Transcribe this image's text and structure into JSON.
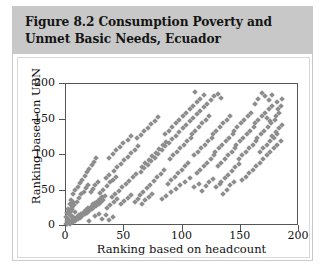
{
  "figure": {
    "title_line1": "Figure 8.2  Consumption Poverty and",
    "title_line2": "Unmet Basic Needs, Ecuador",
    "header_color": "#c8c8c8",
    "body_color": "#ffffff",
    "border_color": "#c9c9c9"
  },
  "chart_data": {
    "type": "scatter",
    "title": "Figure 8.2  Consumption Poverty and Unmet Basic Needs, Ecuador",
    "xlabel": "Ranking based on headcount",
    "ylabel": "Ranking based on UBN",
    "xlim": [
      0,
      200
    ],
    "ylim": [
      0,
      200
    ],
    "xticks": [
      0,
      50,
      100,
      150,
      200
    ],
    "yticks": [
      0,
      50,
      100,
      150,
      200
    ],
    "grid": false,
    "legend": null,
    "marker": {
      "shape": "diamond",
      "color": "#8d8d8d",
      "size": 4
    },
    "series": [
      {
        "name": "Parishes",
        "points": [
          [
            2,
            1
          ],
          [
            3,
            3
          ],
          [
            4,
            2
          ],
          [
            5,
            6
          ],
          [
            6,
            4
          ],
          [
            7,
            9
          ],
          [
            8,
            7
          ],
          [
            5,
            12
          ],
          [
            9,
            5
          ],
          [
            10,
            11
          ],
          [
            11,
            8
          ],
          [
            12,
            14
          ],
          [
            13,
            10
          ],
          [
            14,
            16
          ],
          [
            15,
            13
          ],
          [
            16,
            19
          ],
          [
            17,
            15
          ],
          [
            18,
            21
          ],
          [
            19,
            17
          ],
          [
            20,
            24
          ],
          [
            21,
            20
          ],
          [
            22,
            26
          ],
          [
            23,
            22
          ],
          [
            24,
            29
          ],
          [
            25,
            25
          ],
          [
            26,
            31
          ],
          [
            27,
            27
          ],
          [
            28,
            34
          ],
          [
            29,
            30
          ],
          [
            30,
            36
          ],
          [
            31,
            32
          ],
          [
            32,
            39
          ],
          [
            33,
            35
          ],
          [
            34,
            41
          ],
          [
            4,
            18
          ],
          [
            6,
            23
          ],
          [
            8,
            28
          ],
          [
            10,
            33
          ],
          [
            12,
            38
          ],
          [
            7,
            44
          ],
          [
            9,
            49
          ],
          [
            11,
            54
          ],
          [
            14,
            43
          ],
          [
            16,
            47
          ],
          [
            18,
            52
          ],
          [
            20,
            57
          ],
          [
            22,
            46
          ],
          [
            24,
            51
          ],
          [
            26,
            56
          ],
          [
            28,
            61
          ],
          [
            30,
            45
          ],
          [
            33,
            50
          ],
          [
            36,
            55
          ],
          [
            39,
            60
          ],
          [
            35,
            66
          ],
          [
            38,
            71
          ],
          [
            41,
            63
          ],
          [
            44,
            68
          ],
          [
            13,
            59
          ],
          [
            15,
            64
          ],
          [
            17,
            69
          ],
          [
            19,
            74
          ],
          [
            21,
            79
          ],
          [
            23,
            84
          ],
          [
            25,
            89
          ],
          [
            27,
            94
          ],
          [
            40,
            40
          ],
          [
            43,
            44
          ],
          [
            46,
            48
          ],
          [
            49,
            53
          ],
          [
            52,
            58
          ],
          [
            55,
            62
          ],
          [
            58,
            67
          ],
          [
            61,
            72
          ],
          [
            42,
            76
          ],
          [
            45,
            81
          ],
          [
            48,
            86
          ],
          [
            51,
            91
          ],
          [
            54,
            96
          ],
          [
            57,
            101
          ],
          [
            60,
            106
          ],
          [
            63,
            111
          ],
          [
            64,
            42
          ],
          [
            67,
            47
          ],
          [
            70,
            52
          ],
          [
            73,
            57
          ],
          [
            76,
            62
          ],
          [
            79,
            67
          ],
          [
            82,
            72
          ],
          [
            85,
            77
          ],
          [
            66,
            82
          ],
          [
            69,
            87
          ],
          [
            72,
            92
          ],
          [
            75,
            97
          ],
          [
            78,
            102
          ],
          [
            81,
            107
          ],
          [
            84,
            112
          ],
          [
            87,
            117
          ],
          [
            62,
            122
          ],
          [
            65,
            127
          ],
          [
            68,
            132
          ],
          [
            71,
            137
          ],
          [
            74,
            142
          ],
          [
            77,
            147
          ],
          [
            80,
            152
          ],
          [
            54,
            120
          ],
          [
            57,
            125
          ],
          [
            50,
            115
          ],
          [
            47,
            110
          ],
          [
            44,
            105
          ],
          [
            41,
            100
          ],
          [
            38,
            95
          ],
          [
            88,
            58
          ],
          [
            91,
            63
          ],
          [
            94,
            68
          ],
          [
            97,
            73
          ],
          [
            100,
            78
          ],
          [
            103,
            83
          ],
          [
            106,
            88
          ],
          [
            90,
            93
          ],
          [
            93,
            98
          ],
          [
            96,
            103
          ],
          [
            99,
            108
          ],
          [
            102,
            113
          ],
          [
            105,
            118
          ],
          [
            108,
            123
          ],
          [
            86,
            128
          ],
          [
            89,
            133
          ],
          [
            92,
            138
          ],
          [
            95,
            143
          ],
          [
            98,
            148
          ],
          [
            101,
            153
          ],
          [
            104,
            158
          ],
          [
            107,
            163
          ],
          [
            110,
            168
          ],
          [
            113,
            173
          ],
          [
            116,
            178
          ],
          [
            119,
            183
          ],
          [
            112,
            188
          ],
          [
            109,
            128
          ],
          [
            112,
            133
          ],
          [
            115,
            138
          ],
          [
            118,
            143
          ],
          [
            121,
            148
          ],
          [
            124,
            153
          ],
          [
            111,
            98
          ],
          [
            114,
            103
          ],
          [
            117,
            108
          ],
          [
            120,
            113
          ],
          [
            123,
            118
          ],
          [
            126,
            123
          ],
          [
            113,
            73
          ],
          [
            116,
            78
          ],
          [
            119,
            83
          ],
          [
            122,
            88
          ],
          [
            125,
            93
          ],
          [
            128,
            98
          ],
          [
            127,
            128
          ],
          [
            130,
            133
          ],
          [
            133,
            138
          ],
          [
            136,
            143
          ],
          [
            139,
            148
          ],
          [
            142,
            153
          ],
          [
            129,
            103
          ],
          [
            132,
            108
          ],
          [
            135,
            113
          ],
          [
            138,
            118
          ],
          [
            141,
            123
          ],
          [
            144,
            128
          ],
          [
            131,
            83
          ],
          [
            134,
            88
          ],
          [
            137,
            93
          ],
          [
            140,
            98
          ],
          [
            143,
            103
          ],
          [
            146,
            108
          ],
          [
            145,
            133
          ],
          [
            148,
            138
          ],
          [
            151,
            143
          ],
          [
            154,
            148
          ],
          [
            157,
            153
          ],
          [
            160,
            158
          ],
          [
            147,
            113
          ],
          [
            150,
            118
          ],
          [
            153,
            123
          ],
          [
            156,
            128
          ],
          [
            159,
            133
          ],
          [
            162,
            138
          ],
          [
            149,
            93
          ],
          [
            152,
            98
          ],
          [
            155,
            103
          ],
          [
            158,
            108
          ],
          [
            161,
            113
          ],
          [
            164,
            118
          ],
          [
            163,
            143
          ],
          [
            166,
            148
          ],
          [
            169,
            153
          ],
          [
            172,
            158
          ],
          [
            175,
            163
          ],
          [
            178,
            168
          ],
          [
            165,
            123
          ],
          [
            168,
            128
          ],
          [
            171,
            133
          ],
          [
            174,
            138
          ],
          [
            177,
            143
          ],
          [
            180,
            148
          ],
          [
            167,
            103
          ],
          [
            170,
            108
          ],
          [
            173,
            113
          ],
          [
            176,
            118
          ],
          [
            179,
            123
          ],
          [
            182,
            128
          ],
          [
            181,
            153
          ],
          [
            184,
            158
          ],
          [
            183,
            163
          ],
          [
            185,
            168
          ],
          [
            182,
            173
          ],
          [
            186,
            178
          ],
          [
            178,
            183
          ],
          [
            175,
            176
          ],
          [
            172,
            181
          ],
          [
            169,
            186
          ],
          [
            166,
            178
          ],
          [
            163,
            171
          ],
          [
            184,
            136
          ],
          [
            186,
            141
          ],
          [
            181,
            131
          ],
          [
            178,
            126
          ],
          [
            176,
            146
          ],
          [
            173,
            151
          ],
          [
            131,
            185
          ],
          [
            134,
            179
          ],
          [
            128,
            182
          ],
          [
            125,
            176
          ],
          [
            122,
            171
          ],
          [
            119,
            166
          ],
          [
            116,
            161
          ],
          [
            113,
            156
          ],
          [
            110,
            151
          ],
          [
            107,
            146
          ],
          [
            104,
            141
          ],
          [
            101,
            136
          ],
          [
            98,
            131
          ],
          [
            95,
            126
          ],
          [
            92,
            121
          ],
          [
            89,
            116
          ],
          [
            86,
            111
          ],
          [
            83,
            106
          ],
          [
            80,
            100
          ],
          [
            77,
            95
          ],
          [
            74,
            90
          ],
          [
            71,
            85
          ],
          [
            68,
            80
          ],
          [
            65,
            75
          ],
          [
            143,
            76
          ],
          [
            146,
            81
          ],
          [
            149,
            86
          ],
          [
            140,
            71
          ],
          [
            137,
            66
          ],
          [
            134,
            61
          ],
          [
            152,
            63
          ],
          [
            155,
            68
          ],
          [
            158,
            73
          ],
          [
            161,
            78
          ],
          [
            164,
            83
          ],
          [
            167,
            88
          ],
          [
            170,
            93
          ],
          [
            173,
            98
          ],
          [
            176,
            103
          ],
          [
            179,
            108
          ],
          [
            182,
            113
          ],
          [
            185,
            118
          ],
          [
            36,
            24
          ],
          [
            39,
            28
          ],
          [
            42,
            32
          ],
          [
            45,
            36
          ],
          [
            48,
            30
          ],
          [
            51,
            34
          ],
          [
            54,
            38
          ],
          [
            57,
            42
          ],
          [
            60,
            33
          ],
          [
            63,
            37
          ],
          [
            66,
            29
          ],
          [
            69,
            35
          ],
          [
            72,
            40
          ],
          [
            75,
            44
          ],
          [
            83,
            36
          ],
          [
            87,
            41
          ],
          [
            91,
            46
          ],
          [
            95,
            51
          ],
          [
            99,
            56
          ],
          [
            103,
            61
          ],
          [
            107,
            66
          ],
          [
            111,
            53
          ],
          [
            115,
            58
          ],
          [
            118,
            48
          ],
          [
            121,
            55
          ],
          [
            124,
            60
          ],
          [
            127,
            65
          ],
          [
            130,
            53
          ],
          [
            133,
            58
          ],
          [
            136,
            44
          ],
          [
            139,
            50
          ],
          [
            142,
            56
          ],
          [
            145,
            60
          ],
          [
            26,
            12
          ],
          [
            29,
            16
          ],
          [
            32,
            9
          ],
          [
            35,
            14
          ],
          [
            38,
            7
          ],
          [
            41,
            11
          ],
          [
            21,
            6
          ],
          [
            1,
            2
          ],
          [
            2,
            5
          ],
          [
            3,
            8
          ],
          [
            1,
            11
          ],
          [
            4,
            14
          ],
          [
            2,
            17
          ],
          [
            5,
            20
          ],
          [
            3,
            23
          ],
          [
            6,
            26
          ],
          [
            4,
            29
          ],
          [
            7,
            32
          ],
          [
            5,
            35
          ],
          [
            8,
            10
          ],
          [
            6,
            13
          ],
          [
            9,
            19
          ],
          [
            7,
            4
          ]
        ]
      }
    ]
  },
  "axis": {
    "x_tick_labels": [
      "0",
      "50",
      "100",
      "150",
      "200"
    ],
    "y_tick_labels": [
      "0",
      "50",
      "100",
      "150",
      "200"
    ],
    "x_title": "Ranking based on headcount",
    "y_title": "Ranking based on UBN"
  }
}
